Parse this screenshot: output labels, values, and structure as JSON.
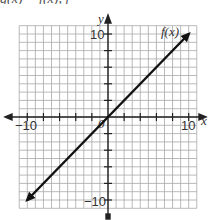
{
  "header": {
    "cropped_text": "g(x) = f(x), f"
  },
  "chart_data": {
    "type": "line",
    "title": "",
    "xlabel": "x",
    "ylabel": "y",
    "xlim": [
      -11,
      11
    ],
    "ylim": [
      -11,
      11
    ],
    "grid": true,
    "x_tick_labels": [
      "-10",
      "10"
    ],
    "y_tick_labels": [
      "10",
      "-10"
    ],
    "origin_label": "0",
    "series": [
      {
        "name": "f(x)",
        "label": "f(x)",
        "equation": "f(x) = x",
        "x": [
          -10,
          10
        ],
        "y": [
          -10,
          10
        ],
        "arrows_both_ends": true
      }
    ],
    "annotations": [
      "f(x)"
    ]
  },
  "labels": {
    "x_axis": "x",
    "y_axis": "y",
    "x_min": "−10",
    "x_max": "10",
    "y_max": "10",
    "y_min": "−10",
    "origin": "0",
    "function": "f(x)"
  }
}
